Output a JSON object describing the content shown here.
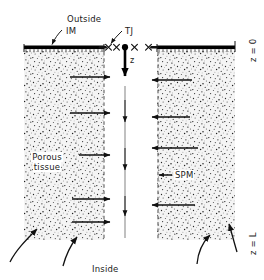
{
  "figure": {
    "title_alt": "Schematic of porous tissue with intestinal membrane, tight junctions and z-axis",
    "labels": {
      "outside": "Outside",
      "inside": "Inside",
      "im": "IM",
      "tj": "TJ",
      "spm": "SPM",
      "porous_line1": "Porous",
      "porous_line2": "tissue",
      "z_axis": "z",
      "z_top": "z = 0",
      "z_bottom": "z = L"
    },
    "colors": {
      "ink": "#1a1a1a",
      "membrane": "#000000",
      "tissue_fill": "#f2f2f2",
      "stipple": "#2b2b2b",
      "background": "#ffffff"
    },
    "geometry": {
      "left_block": {
        "x": 24,
        "y": 50,
        "width": 80,
        "height": 190
      },
      "right_block": {
        "x": 157,
        "y": 50,
        "width": 78,
        "height": 190
      },
      "membrane_y": 48,
      "z_axis_x": 125,
      "z_top_y": 47,
      "z_bottom_y": 240
    },
    "flux_arrows": {
      "left_count": 5,
      "right_count": 4,
      "center_count": 4,
      "left_direction": "right",
      "right_direction": "left",
      "center_direction": "down"
    },
    "tight_junction_marks": 4
  }
}
